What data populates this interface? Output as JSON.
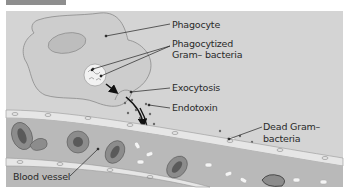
{
  "figure": {
    "header_bar_color": "#8e8e8e",
    "background_color": "#d4d4d4"
  },
  "labels": {
    "phagocyte": "Phagocyte",
    "phagocytized_line1": "Phagocytized",
    "phagocytized_line2": "Gram– bacteria",
    "exocytosis": "Exocytosis",
    "endotoxin": "Endotoxin",
    "dead_line1": "Dead Gram–",
    "dead_line2": "bacteria",
    "blood_vessel": "Blood vessel"
  },
  "colors": {
    "cell_fill": "#cdcdcd",
    "cell_outline": "#8a8a8a",
    "vessel_fill": "#b9b9b9",
    "rbc_fill": "#8c8c8c",
    "rbc_center": "#555555",
    "endothelium": "#eeeeee",
    "dot": "#6a6a6a",
    "leader_line": "#222222"
  }
}
